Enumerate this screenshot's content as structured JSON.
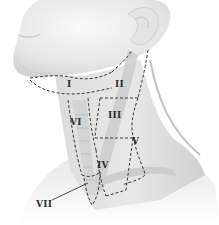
{
  "figure": {
    "levels": [
      {
        "id": "I",
        "label": "I"
      },
      {
        "id": "II",
        "label": "II"
      },
      {
        "id": "III",
        "label": "III"
      },
      {
        "id": "IV",
        "label": "IV"
      },
      {
        "id": "V",
        "label": "V"
      },
      {
        "id": "VI",
        "label": "VI"
      },
      {
        "id": "VII",
        "label": "VII"
      }
    ]
  },
  "colors": {
    "skin": "#ececec",
    "skin_shadow": "#d6d6d6",
    "muscle": "#c9c9c9",
    "dashed_line": "#3a3a3a",
    "label_text": "#2b2b2b"
  }
}
